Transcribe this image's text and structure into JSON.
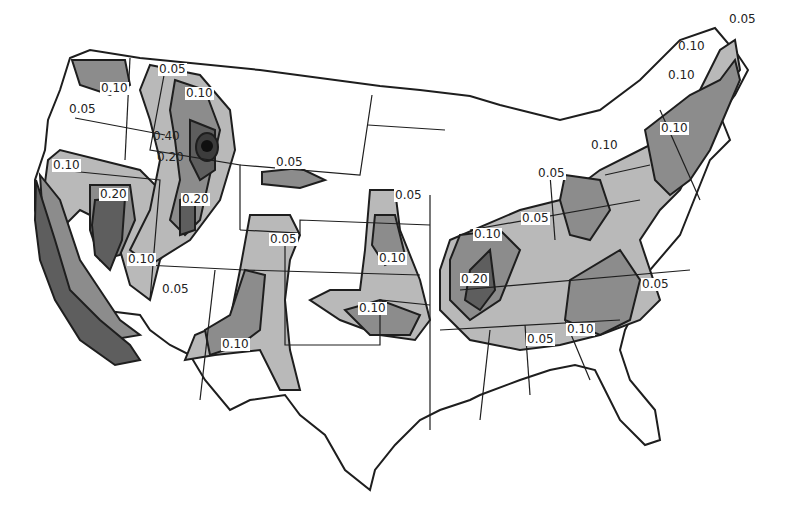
{
  "map": {
    "subject": "Contour map of the contiguous United States",
    "colors": {
      "background": "#ffffff",
      "outline": "#1e1e1e",
      "level_0_05": "#b9b9b9",
      "level_0_10": "#8c8c8c",
      "level_0_20": "#5e5e5e",
      "level_0_40": "#1c1c1c"
    },
    "contour_levels": [
      "0.05",
      "0.10",
      "0.20",
      "0.40"
    ],
    "labels": [
      {
        "text": "0.10",
        "x": 100,
        "y": 89,
        "boxed": true
      },
      {
        "text": "0.05",
        "x": 68,
        "y": 110,
        "boxed": false
      },
      {
        "text": "0.05",
        "x": 158,
        "y": 70,
        "boxed": true
      },
      {
        "text": "0.10",
        "x": 185,
        "y": 94,
        "boxed": true
      },
      {
        "text": "0.40",
        "x": 152,
        "y": 137,
        "boxed": false
      },
      {
        "text": "0.20",
        "x": 156,
        "y": 158,
        "boxed": false
      },
      {
        "text": "0.10",
        "x": 52,
        "y": 166,
        "boxed": true
      },
      {
        "text": "0.20",
        "x": 99,
        "y": 195,
        "boxed": true
      },
      {
        "text": "0.20",
        "x": 181,
        "y": 200,
        "boxed": true
      },
      {
        "text": "0.10",
        "x": 127,
        "y": 260,
        "boxed": true
      },
      {
        "text": "0.05",
        "x": 161,
        "y": 290,
        "boxed": false
      },
      {
        "text": "0.10",
        "x": 221,
        "y": 345,
        "boxed": true
      },
      {
        "text": "0.05",
        "x": 275,
        "y": 163,
        "boxed": true
      },
      {
        "text": "0.05",
        "x": 269,
        "y": 240,
        "boxed": true
      },
      {
        "text": "0.05",
        "x": 394,
        "y": 196,
        "boxed": true
      },
      {
        "text": "0.10",
        "x": 378,
        "y": 259,
        "boxed": true
      },
      {
        "text": "0.10",
        "x": 358,
        "y": 309,
        "boxed": true
      },
      {
        "text": "0.10",
        "x": 473,
        "y": 235,
        "boxed": true
      },
      {
        "text": "0.05",
        "x": 521,
        "y": 219,
        "boxed": true
      },
      {
        "text": "0.20",
        "x": 460,
        "y": 280,
        "boxed": true
      },
      {
        "text": "0.05",
        "x": 537,
        "y": 174,
        "boxed": true
      },
      {
        "text": "0.10",
        "x": 566,
        "y": 330,
        "boxed": true
      },
      {
        "text": "0.05",
        "x": 526,
        "y": 340,
        "boxed": true
      },
      {
        "text": "0.05",
        "x": 641,
        "y": 285,
        "boxed": true
      },
      {
        "text": "0.10",
        "x": 590,
        "y": 146,
        "boxed": false
      },
      {
        "text": "0.10",
        "x": 660,
        "y": 129,
        "boxed": true
      },
      {
        "text": "0.10",
        "x": 667,
        "y": 76,
        "boxed": false
      },
      {
        "text": "0.10",
        "x": 677,
        "y": 47,
        "boxed": false
      },
      {
        "text": "0.05",
        "x": 728,
        "y": 20,
        "boxed": false
      }
    ]
  }
}
